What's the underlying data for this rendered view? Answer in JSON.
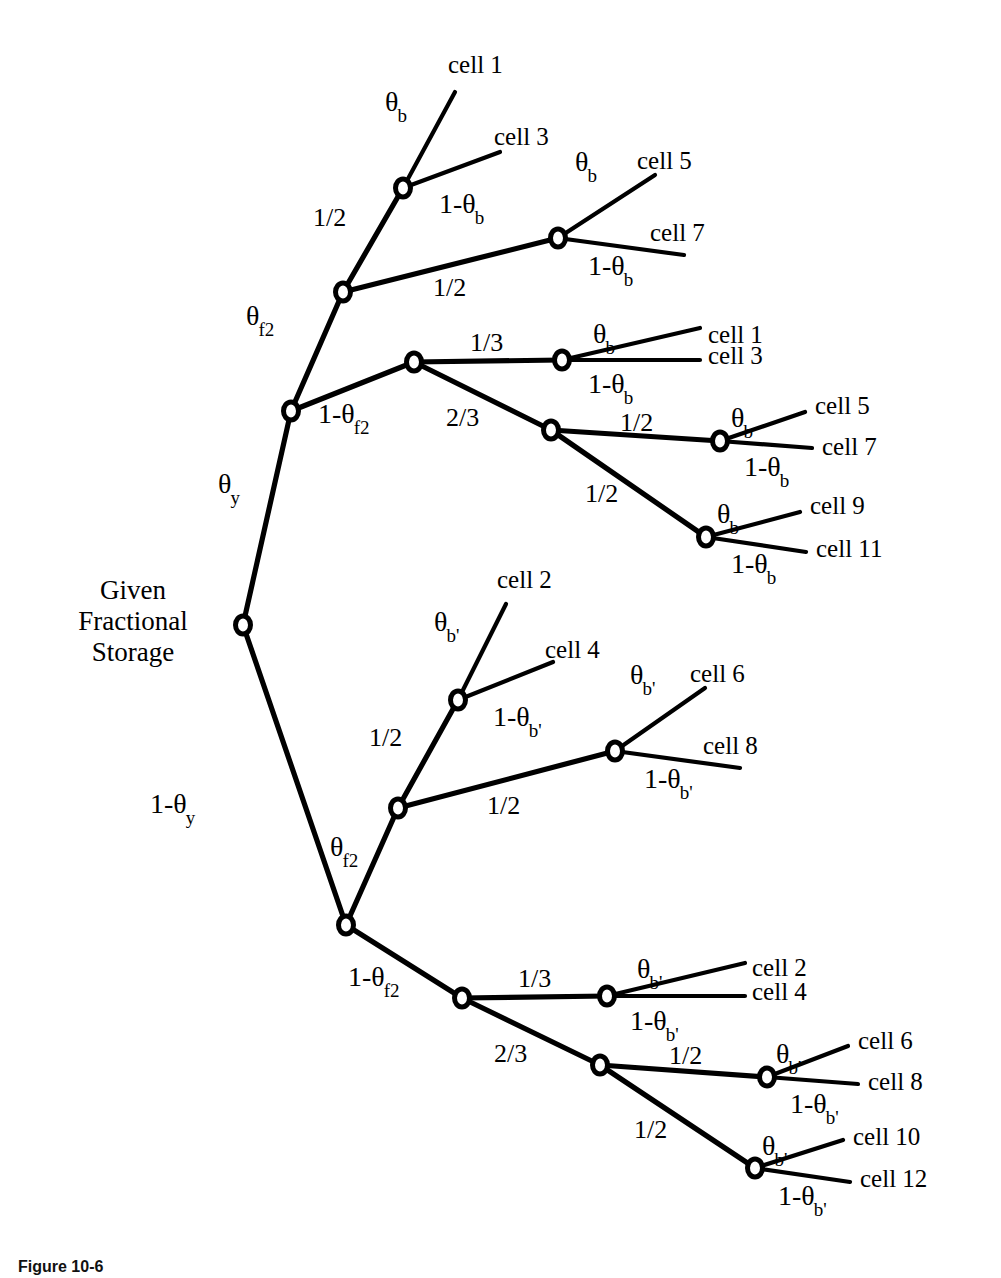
{
  "figure": {
    "caption": "Figure 10-6",
    "root_label": "Given\nFractional\nStorage"
  },
  "colors": {
    "line": "#000000",
    "node_fill": "#ffffff",
    "background": "#ffffff"
  },
  "chart_data": {
    "type": "diagram",
    "subtype": "probability-decision-tree",
    "root": {
      "id": "root",
      "x": 243,
      "y": 625,
      "label": "Given Fractional Storage"
    },
    "nodes": [
      {
        "id": "root",
        "x": 243,
        "y": 625
      },
      {
        "id": "u1",
        "x": 291,
        "y": 411
      },
      {
        "id": "u1a",
        "x": 343,
        "y": 292
      },
      {
        "id": "u1a1",
        "x": 403,
        "y": 188
      },
      {
        "id": "u1a2",
        "x": 558,
        "y": 238
      },
      {
        "id": "u1b",
        "x": 414,
        "y": 362
      },
      {
        "id": "u1b1",
        "x": 562,
        "y": 360
      },
      {
        "id": "u1b2",
        "x": 551,
        "y": 430
      },
      {
        "id": "u1b2a",
        "x": 720,
        "y": 441
      },
      {
        "id": "u1b2b",
        "x": 706,
        "y": 537
      },
      {
        "id": "d1",
        "x": 346,
        "y": 925
      },
      {
        "id": "d1a",
        "x": 398,
        "y": 808
      },
      {
        "id": "d1a1",
        "x": 458,
        "y": 700
      },
      {
        "id": "d1a2",
        "x": 615,
        "y": 751
      },
      {
        "id": "d1b",
        "x": 462,
        "y": 998
      },
      {
        "id": "d1b1",
        "x": 607,
        "y": 996
      },
      {
        "id": "d1b2",
        "x": 600,
        "y": 1065
      },
      {
        "id": "d1b2a",
        "x": 767,
        "y": 1077
      },
      {
        "id": "d1b2b",
        "x": 755,
        "y": 1168
      }
    ],
    "edges": [
      {
        "from": "root",
        "to": "u1",
        "label": "θ_y",
        "label_x": 218,
        "label_y": 470
      },
      {
        "from": "root",
        "to": "d1",
        "label": "1-θ_y",
        "label_x": 150,
        "label_y": 790
      },
      {
        "from": "u1",
        "to": "u1a",
        "label": "θ_f2",
        "label_x": 246,
        "label_y": 302
      },
      {
        "from": "u1",
        "to": "u1b",
        "label": "1-θ_f2",
        "label_x": 318,
        "label_y": 400
      },
      {
        "from": "u1a",
        "to": "u1a1",
        "label": "1/2",
        "label_x": 313,
        "label_y": 205
      },
      {
        "from": "u1a",
        "to": "u1a2",
        "label": "1/2",
        "label_x": 433,
        "label_y": 275
      },
      {
        "from": "u1a1",
        "to": "cell1_A",
        "label": "θ_b",
        "label_x": 385,
        "label_y": 88
      },
      {
        "from": "u1a1",
        "to": "cell3_A",
        "label": "1-θ_b",
        "label_x": 439,
        "label_y": 190
      },
      {
        "from": "u1a2",
        "to": "cell5_A",
        "label": "θ_b",
        "label_x": 575,
        "label_y": 148
      },
      {
        "from": "u1a2",
        "to": "cell7_A",
        "label": "1-θ_b",
        "label_x": 588,
        "label_y": 252
      },
      {
        "from": "u1b",
        "to": "u1b1",
        "label": "1/3",
        "label_x": 470,
        "label_y": 330
      },
      {
        "from": "u1b",
        "to": "u1b2",
        "label": "2/3",
        "label_x": 446,
        "label_y": 405
      },
      {
        "from": "u1b1",
        "to": "cell1_B",
        "label": "θ_b",
        "label_x": 593,
        "label_y": 320
      },
      {
        "from": "u1b1",
        "to": "cell3_B",
        "label": "1-θ_b",
        "label_x": 588,
        "label_y": 370
      },
      {
        "from": "u1b2",
        "to": "u1b2a",
        "label": "1/2",
        "label_x": 620,
        "label_y": 410
      },
      {
        "from": "u1b2",
        "to": "u1b2b",
        "label": "1/2",
        "label_x": 585,
        "label_y": 481
      },
      {
        "from": "u1b2a",
        "to": "cell5_B",
        "label": "θ_b",
        "label_x": 731,
        "label_y": 404
      },
      {
        "from": "u1b2a",
        "to": "cell7_B",
        "label": "1-θ_b",
        "label_x": 744,
        "label_y": 453
      },
      {
        "from": "u1b2b",
        "to": "cell9_B",
        "label": "θ_b",
        "label_x": 717,
        "label_y": 500
      },
      {
        "from": "u1b2b",
        "to": "cell11_B",
        "label": "1-θ_b",
        "label_x": 731,
        "label_y": 550
      },
      {
        "from": "d1",
        "to": "d1a",
        "label": "θ_f2",
        "label_x": 330,
        "label_y": 833
      },
      {
        "from": "d1",
        "to": "d1b",
        "label": "1-θ_f2",
        "label_x": 348,
        "label_y": 963
      },
      {
        "from": "d1a",
        "to": "d1a1",
        "label": "1/2",
        "label_x": 369,
        "label_y": 725
      },
      {
        "from": "d1a",
        "to": "d1a2",
        "label": "1/2",
        "label_x": 487,
        "label_y": 793
      },
      {
        "from": "d1a1",
        "to": "cell2_A",
        "label": "θ_b'",
        "label_x": 434,
        "label_y": 608
      },
      {
        "from": "d1a1",
        "to": "cell4_A",
        "label": "1-θ_b'",
        "label_x": 493,
        "label_y": 703
      },
      {
        "from": "d1a2",
        "to": "cell6_A",
        "label": "θ_b'",
        "label_x": 630,
        "label_y": 661
      },
      {
        "from": "d1a2",
        "to": "cell8_A",
        "label": "1-θ_b'",
        "label_x": 644,
        "label_y": 765
      },
      {
        "from": "d1b",
        "to": "d1b1",
        "label": "1/3",
        "label_x": 518,
        "label_y": 966
      },
      {
        "from": "d1b",
        "to": "d1b2",
        "label": "2/3",
        "label_x": 494,
        "label_y": 1041
      },
      {
        "from": "d1b1",
        "to": "cell2_B",
        "label": "θ_b'",
        "label_x": 637,
        "label_y": 955
      },
      {
        "from": "d1b1",
        "to": "cell4_B",
        "label": "1-θ_b'",
        "label_x": 630,
        "label_y": 1007
      },
      {
        "from": "d1b2",
        "to": "d1b2a",
        "label": "1/2",
        "label_x": 669,
        "label_y": 1043
      },
      {
        "from": "d1b2",
        "to": "d1b2b",
        "label": "1/2",
        "label_x": 634,
        "label_y": 1117
      },
      {
        "from": "d1b2a",
        "to": "cell6_B",
        "label": "θ_b'",
        "label_x": 776,
        "label_y": 1040
      },
      {
        "from": "d1b2a",
        "to": "cell8_B",
        "label": "1-θ_b'",
        "label_x": 790,
        "label_y": 1090
      },
      {
        "from": "d1b2b",
        "to": "cell10_B",
        "label": "θ_b'",
        "label_x": 762,
        "label_y": 1132
      },
      {
        "from": "d1b2b",
        "to": "cell12_B",
        "label": "1-θ_b'",
        "label_x": 778,
        "label_y": 1182
      }
    ],
    "leaves": [
      {
        "id": "cell1_A",
        "label": "cell 1",
        "tip_x": 455,
        "tip_y": 92,
        "text_x": 448,
        "text_y": 52
      },
      {
        "id": "cell3_A",
        "label": "cell 3",
        "tip_x": 500,
        "tip_y": 152,
        "text_x": 494,
        "text_y": 124
      },
      {
        "id": "cell5_A",
        "label": "cell 5",
        "tip_x": 655,
        "tip_y": 175,
        "text_x": 637,
        "text_y": 148
      },
      {
        "id": "cell7_A",
        "label": "cell 7",
        "tip_x": 684,
        "tip_y": 255,
        "text_x": 650,
        "text_y": 220
      },
      {
        "id": "cell1_B",
        "label": "cell 1",
        "tip_x": 700,
        "tip_y": 328,
        "text_x": 708,
        "text_y": 322
      },
      {
        "id": "cell3_B",
        "label": "cell 3",
        "tip_x": 700,
        "tip_y": 360,
        "text_x": 708,
        "text_y": 343
      },
      {
        "id": "cell5_B",
        "label": "cell 5",
        "tip_x": 805,
        "tip_y": 412,
        "text_x": 815,
        "text_y": 393
      },
      {
        "id": "cell7_B",
        "label": "cell 7",
        "tip_x": 812,
        "tip_y": 448,
        "text_x": 822,
        "text_y": 434
      },
      {
        "id": "cell9_B",
        "label": "cell 9",
        "tip_x": 800,
        "tip_y": 512,
        "text_x": 810,
        "text_y": 493
      },
      {
        "id": "cell11_B",
        "label": "cell 11",
        "tip_x": 806,
        "tip_y": 552,
        "text_x": 816,
        "text_y": 536
      },
      {
        "id": "cell2_A",
        "label": "cell 2",
        "tip_x": 506,
        "tip_y": 604,
        "text_x": 497,
        "text_y": 567
      },
      {
        "id": "cell4_A",
        "label": "cell 4",
        "tip_x": 553,
        "tip_y": 662,
        "text_x": 545,
        "text_y": 637
      },
      {
        "id": "cell6_A",
        "label": "cell 6",
        "tip_x": 705,
        "tip_y": 688,
        "text_x": 690,
        "text_y": 661
      },
      {
        "id": "cell8_A",
        "label": "cell 8",
        "tip_x": 740,
        "tip_y": 768,
        "text_x": 703,
        "text_y": 733
      },
      {
        "id": "cell2_B",
        "label": "cell 2",
        "tip_x": 745,
        "tip_y": 963,
        "text_x": 752,
        "text_y": 955
      },
      {
        "id": "cell4_B",
        "label": "cell 4",
        "tip_x": 745,
        "tip_y": 996,
        "text_x": 752,
        "text_y": 979
      },
      {
        "id": "cell6_B",
        "label": "cell 6",
        "tip_x": 848,
        "tip_y": 1046,
        "text_x": 858,
        "text_y": 1028
      },
      {
        "id": "cell8_B",
        "label": "cell 8",
        "tip_x": 858,
        "tip_y": 1084,
        "text_x": 868,
        "text_y": 1069
      },
      {
        "id": "cell10_B",
        "label": "cell 10",
        "tip_x": 843,
        "tip_y": 1140,
        "text_x": 853,
        "text_y": 1124
      },
      {
        "id": "cell12_B",
        "label": "cell 12",
        "tip_x": 850,
        "tip_y": 1182,
        "text_x": 860,
        "text_y": 1166
      }
    ],
    "probability_symbols": [
      "θ_y",
      "1-θ_y",
      "θ_f2",
      "1-θ_f2",
      "θ_b",
      "1-θ_b",
      "θ_b'",
      "1-θ_b'",
      "1/2",
      "1/3",
      "2/3"
    ],
    "cell_labels": [
      "cell 1",
      "cell 2",
      "cell 3",
      "cell 4",
      "cell 5",
      "cell 6",
      "cell 7",
      "cell 8",
      "cell 9",
      "cell 10",
      "cell 11",
      "cell 12"
    ]
  }
}
